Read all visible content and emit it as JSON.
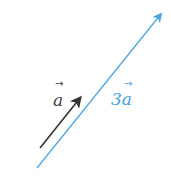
{
  "diagram": {
    "vectors": [
      {
        "name": "a",
        "label": "a",
        "color": "#333333",
        "from": [
          40,
          148
        ],
        "to": [
          82,
          96
        ]
      },
      {
        "name": "3a",
        "label": "3a",
        "color": "#4aa3df",
        "from": [
          37,
          168
        ],
        "to": [
          163,
          12
        ]
      }
    ],
    "labels": {
      "a": "a",
      "three_a": "3a",
      "arrow_glyph": "→"
    }
  }
}
